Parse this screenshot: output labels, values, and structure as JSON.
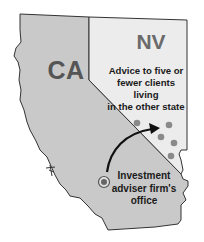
{
  "map": {
    "states": [
      {
        "code": "CA",
        "label": "CA",
        "fill": "#c8c8c8"
      },
      {
        "code": "NV",
        "label": "NV",
        "fill": "#ebebeb"
      }
    ],
    "annotations": {
      "advice": "Advice to five or fewer clients living in the other state",
      "advice_lines": [
        "Advice to five or",
        "fewer clients living",
        "in the other state"
      ],
      "office_lines": [
        "Investment",
        "adviser firm's",
        "office"
      ]
    },
    "markers": {
      "office": {
        "x": 104,
        "y": 182,
        "color": "#666666"
      },
      "clients": [
        {
          "x": 137,
          "y": 123
        },
        {
          "x": 169,
          "y": 125
        },
        {
          "x": 161,
          "y": 137
        },
        {
          "x": 174,
          "y": 143
        },
        {
          "x": 171,
          "y": 156
        }
      ],
      "client_color": "#8a8a8a"
    },
    "arrow": {
      "from": "office",
      "to": "NV",
      "color": "#111111"
    }
  }
}
